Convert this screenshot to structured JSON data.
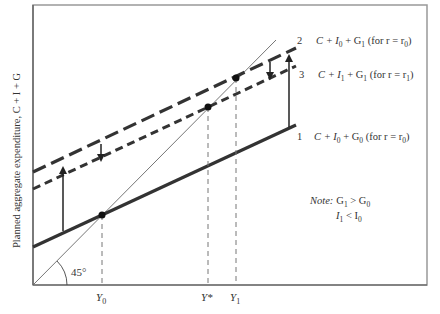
{
  "axes": {
    "ylabel": "Planned aggregate expenditure, C + I + G",
    "xticks": [
      {
        "label": "Y",
        "sub": "0",
        "x": 102
      },
      {
        "label": "Y*",
        "sub": "",
        "x": 208
      },
      {
        "label": "Y",
        "sub": "1",
        "x": 236
      }
    ],
    "angle_label": "45°"
  },
  "lines": [
    {
      "num": "1",
      "label_main": "C + I",
      "i_sub": "0",
      "g_part": " + G",
      "g_sub": "0",
      "r_part": " (for r = r",
      "r_sub": "0",
      "close": ")"
    },
    {
      "num": "2",
      "label_main": "C + I",
      "i_sub": "0",
      "g_part": " + G",
      "g_sub": "1",
      "r_part": " (for r = r",
      "r_sub": "0",
      "close": ")"
    },
    {
      "num": "3",
      "label_main": "C + I",
      "i_sub": "1",
      "g_part": " + G",
      "g_sub": "1",
      "r_part": " (for r = r",
      "r_sub": "1",
      "close": ")"
    }
  ],
  "note": {
    "title": "Note:",
    "line1_a": "G",
    "line1_a_sub": "1",
    "line1_op": " > G",
    "line1_b_sub": "0",
    "line2_a": "I",
    "line2_a_sub": "1",
    "line2_op": " < I",
    "line2_b_sub": "0"
  },
  "colors": {
    "frame": "#999999",
    "line": "#333333",
    "thin": "#555555"
  }
}
